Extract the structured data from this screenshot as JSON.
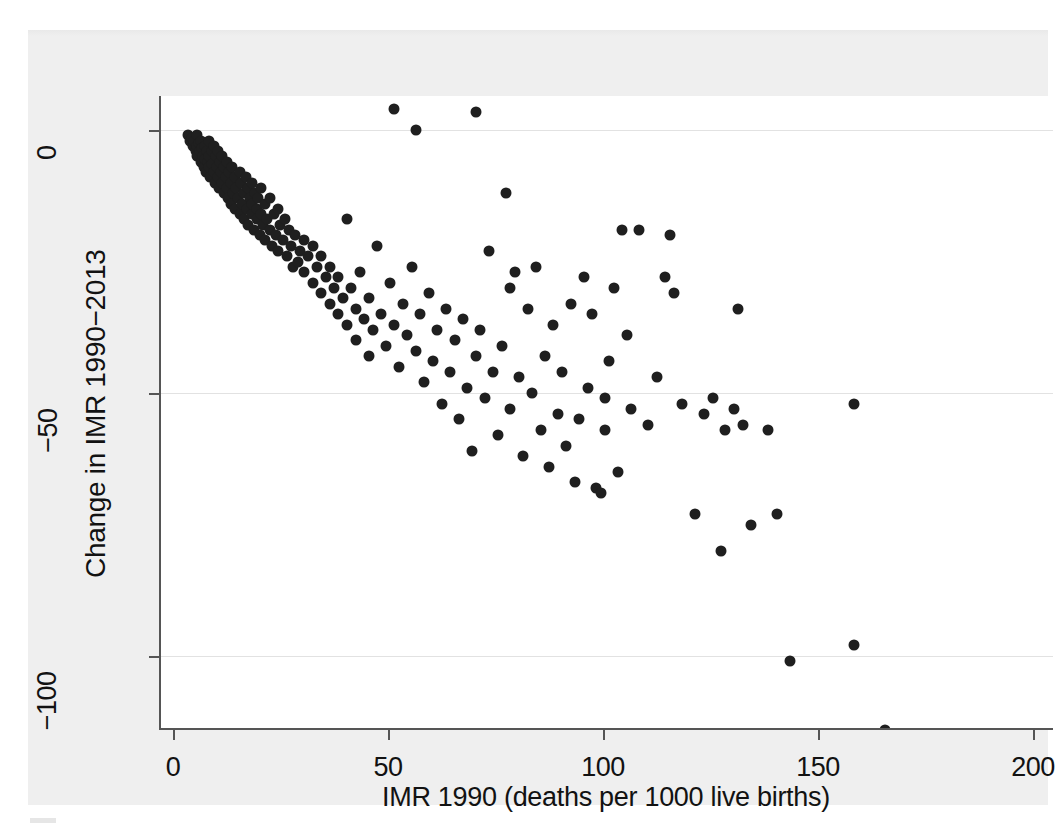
{
  "figure": {
    "background_color": "#efefef",
    "plot_background_color": "#ffffff",
    "marker_color": "#1f1f1f",
    "axis_color": "#555555",
    "gridline_color": "#e2e2e2"
  },
  "chart_data": {
    "type": "scatter",
    "title": "",
    "subtitle": "",
    "xlabel": "IMR 1990 (deaths per 1000 live births)",
    "ylabel": "Change in IMR 1990−2013",
    "xlim": [
      0,
      200
    ],
    "ylim": [
      -120,
      8
    ],
    "xticks": [
      0,
      50,
      100,
      150,
      200
    ],
    "xtick_labels": [
      "0",
      "50",
      "100",
      "150",
      "200"
    ],
    "yticks": [
      0,
      -50,
      -100
    ],
    "ytick_labels": [
      "0",
      "−50",
      "−100"
    ],
    "grid": "horizontal gridlines at y ticks only",
    "legend": "none",
    "annotations": [],
    "marker": {
      "shape": "circle",
      "size_px": 11,
      "color": "#1f1f1f"
    },
    "n_points": 196,
    "points": [
      [
        3,
        -1
      ],
      [
        3.5,
        -2
      ],
      [
        4,
        -1.5
      ],
      [
        4.2,
        -3
      ],
      [
        4.5,
        -2
      ],
      [
        4.8,
        -4
      ],
      [
        5,
        -1
      ],
      [
        5,
        -3
      ],
      [
        5.2,
        -5
      ],
      [
        5.5,
        -2.5
      ],
      [
        5.8,
        -4
      ],
      [
        6,
        -6
      ],
      [
        6,
        -2
      ],
      [
        6.3,
        -3.5
      ],
      [
        6.5,
        -5
      ],
      [
        6.8,
        -7
      ],
      [
        7,
        -3
      ],
      [
        7,
        -5.5
      ],
      [
        7.2,
        -8
      ],
      [
        7.5,
        -4
      ],
      [
        7.6,
        -6
      ],
      [
        7.8,
        -2
      ],
      [
        8,
        -5
      ],
      [
        8,
        -7
      ],
      [
        8.2,
        -9
      ],
      [
        8.5,
        -4
      ],
      [
        8.7,
        -6.5
      ],
      [
        9,
        -3
      ],
      [
        9,
        -8
      ],
      [
        9.2,
        -10
      ],
      [
        9.5,
        -5
      ],
      [
        9.7,
        -7
      ],
      [
        10,
        -4
      ],
      [
        10,
        -9
      ],
      [
        10.2,
        -11
      ],
      [
        10.5,
        -6
      ],
      [
        10.8,
        -8
      ],
      [
        11,
        -5
      ],
      [
        11,
        -10
      ],
      [
        11.3,
        -12
      ],
      [
        11.5,
        -7
      ],
      [
        11.8,
        -9
      ],
      [
        12,
        -6
      ],
      [
        12,
        -11
      ],
      [
        12.4,
        -13
      ],
      [
        12.6,
        -8
      ],
      [
        13,
        -10
      ],
      [
        13,
        -14
      ],
      [
        13.3,
        -7
      ],
      [
        13.6,
        -12
      ],
      [
        14,
        -9
      ],
      [
        14,
        -15
      ],
      [
        14.3,
        -11
      ],
      [
        14.6,
        -13
      ],
      [
        15,
        -8
      ],
      [
        15,
        -16
      ],
      [
        15.3,
        -10
      ],
      [
        15.6,
        -14
      ],
      [
        16,
        -12
      ],
      [
        16,
        -17
      ],
      [
        16.4,
        -9
      ],
      [
        16.8,
        -15
      ],
      [
        17,
        -11
      ],
      [
        17,
        -18
      ],
      [
        17.4,
        -13
      ],
      [
        17.8,
        -16
      ],
      [
        18,
        -10
      ],
      [
        18,
        -14
      ],
      [
        18.3,
        -19
      ],
      [
        18.7,
        -12
      ],
      [
        19,
        -15
      ],
      [
        19,
        -17
      ],
      [
        19.4,
        -13
      ],
      [
        19.8,
        -20
      ],
      [
        20,
        -11
      ],
      [
        20,
        -16
      ],
      [
        20.5,
        -18
      ],
      [
        21,
        -14
      ],
      [
        21,
        -21
      ],
      [
        21.5,
        -17
      ],
      [
        22,
        -13
      ],
      [
        22,
        -19
      ],
      [
        22.5,
        -22
      ],
      [
        23,
        -16
      ],
      [
        23.5,
        -20
      ],
      [
        24,
        -15
      ],
      [
        24,
        -23
      ],
      [
        24.5,
        -18
      ],
      [
        25,
        -21
      ],
      [
        25.5,
        -17
      ],
      [
        26,
        -24
      ],
      [
        26.5,
        -19
      ],
      [
        27,
        -22
      ],
      [
        27.5,
        -26
      ],
      [
        28,
        -20
      ],
      [
        28.5,
        -25
      ],
      [
        29,
        -23
      ],
      [
        30,
        -21
      ],
      [
        30,
        -27
      ],
      [
        31,
        -24
      ],
      [
        32,
        -22
      ],
      [
        32,
        -29
      ],
      [
        33,
        -26
      ],
      [
        34,
        -31
      ],
      [
        34,
        -24
      ],
      [
        35,
        -28
      ],
      [
        36,
        -33
      ],
      [
        36,
        -26
      ],
      [
        37,
        -30
      ],
      [
        38,
        -35
      ],
      [
        38,
        -28
      ],
      [
        39,
        -32
      ],
      [
        40,
        -37
      ],
      [
        40,
        -17
      ],
      [
        41,
        -30
      ],
      [
        42,
        -34
      ],
      [
        42,
        -40
      ],
      [
        43,
        -27
      ],
      [
        44,
        -36
      ],
      [
        45,
        -32
      ],
      [
        45,
        -43
      ],
      [
        46,
        -38
      ],
      [
        47,
        -22
      ],
      [
        48,
        -35
      ],
      [
        49,
        -41
      ],
      [
        50,
        -29
      ],
      [
        51,
        4
      ],
      [
        51,
        -37
      ],
      [
        52,
        -45
      ],
      [
        53,
        -33
      ],
      [
        54,
        -39
      ],
      [
        55,
        -26
      ],
      [
        56,
        0
      ],
      [
        56,
        -42
      ],
      [
        57,
        -35
      ],
      [
        58,
        -48
      ],
      [
        59,
        -31
      ],
      [
        60,
        -44
      ],
      [
        61,
        -38
      ],
      [
        62,
        -52
      ],
      [
        63,
        -34
      ],
      [
        64,
        -46
      ],
      [
        65,
        -40
      ],
      [
        66,
        -55
      ],
      [
        67,
        -36
      ],
      [
        68,
        -49
      ],
      [
        69,
        -61
      ],
      [
        70,
        3.5
      ],
      [
        70,
        -43
      ],
      [
        71,
        -38
      ],
      [
        72,
        -51
      ],
      [
        73,
        -23
      ],
      [
        74,
        -46
      ],
      [
        75,
        -58
      ],
      [
        76,
        -41
      ],
      [
        77,
        -12
      ],
      [
        78,
        -53
      ],
      [
        78,
        -30
      ],
      [
        79,
        -27
      ],
      [
        80,
        -47
      ],
      [
        81,
        -62
      ],
      [
        82,
        -34
      ],
      [
        83,
        -50
      ],
      [
        84,
        -26
      ],
      [
        85,
        -57
      ],
      [
        86,
        -43
      ],
      [
        87,
        -64
      ],
      [
        88,
        -37
      ],
      [
        89,
        -54
      ],
      [
        90,
        -46
      ],
      [
        91,
        -60
      ],
      [
        92,
        -33
      ],
      [
        93,
        -67
      ],
      [
        94,
        -55
      ],
      [
        95,
        -28
      ],
      [
        96,
        -49
      ],
      [
        97,
        -35
      ],
      [
        98,
        -68
      ],
      [
        99,
        -69
      ],
      [
        100,
        -51
      ],
      [
        100,
        -57
      ],
      [
        101,
        -44
      ],
      [
        102,
        -30
      ],
      [
        103,
        -65
      ],
      [
        104,
        -19
      ],
      [
        105,
        -39
      ],
      [
        106,
        -53
      ],
      [
        108,
        -19
      ],
      [
        110,
        -56
      ],
      [
        112,
        -47
      ],
      [
        114,
        -28
      ],
      [
        115,
        -20
      ],
      [
        116,
        -31
      ],
      [
        118,
        -52
      ],
      [
        121,
        -73
      ],
      [
        123,
        -54
      ],
      [
        125,
        -51
      ],
      [
        127,
        -80
      ],
      [
        128,
        -57
      ],
      [
        130,
        -53
      ],
      [
        131,
        -34
      ],
      [
        132,
        -56
      ],
      [
        134,
        -75
      ],
      [
        138,
        -57
      ],
      [
        140,
        -73
      ],
      [
        143,
        -101
      ],
      [
        158,
        -52
      ],
      [
        158,
        -98
      ],
      [
        165,
        -114
      ]
    ]
  },
  "axes": {
    "x": {
      "label": "IMR 1990 (deaths per 1000 live births)",
      "ticks": [
        {
          "value": 0,
          "label": "0"
        },
        {
          "value": 50,
          "label": "50"
        },
        {
          "value": 100,
          "label": "100"
        },
        {
          "value": 150,
          "label": "150"
        },
        {
          "value": 200,
          "label": "200"
        }
      ]
    },
    "y": {
      "label": "Change in IMR 1990−2013",
      "ticks": [
        {
          "value": 0,
          "label": "0"
        },
        {
          "value": -50,
          "label": "−50"
        },
        {
          "value": -100,
          "label": "−100"
        }
      ]
    }
  }
}
